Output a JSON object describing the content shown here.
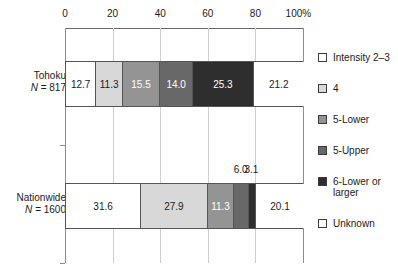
{
  "chart_data": {
    "type": "bar",
    "orientation": "horizontal",
    "stacked": true,
    "stacked_mode": "percent",
    "title": "",
    "subtitle": "",
    "xlabel": "",
    "ylabel": "",
    "xlim": [
      0,
      100
    ],
    "xticks": [
      0,
      20,
      40,
      60,
      80,
      100
    ],
    "xtick_labels": [
      "0",
      "20",
      "40",
      "60",
      "80",
      "100%"
    ],
    "grid": true,
    "grid_axis": "x",
    "legend_position": "right",
    "categories": [
      "Tohoku",
      "Nationwide"
    ],
    "category_labels": [
      {
        "name": "Tohoku",
        "n_text": "N = 817",
        "n_prefix": "N",
        "n_value": "= 817"
      },
      {
        "name": "Nationwide",
        "n_text": "N = 1600",
        "n_prefix": "N",
        "n_value": "= 1600"
      }
    ],
    "series": [
      {
        "name": "Intensity 2–3",
        "color": "#ffffff",
        "values": [
          12.7,
          31.6
        ]
      },
      {
        "name": "4",
        "color": "#d8d8d8",
        "values": [
          11.3,
          27.9
        ]
      },
      {
        "name": "5-Lower",
        "color": "#949494",
        "values": [
          15.5,
          11.3
        ]
      },
      {
        "name": "5-Upper",
        "color": "#686868",
        "values": [
          14.0,
          6.0
        ]
      },
      {
        "name": "6-Lower or\nlarger",
        "color": "#2e2e2e",
        "values": [
          25.3,
          3.1
        ]
      },
      {
        "name": "Unknown",
        "color": "#ffffff",
        "values": [
          21.2,
          20.1
        ]
      }
    ],
    "bars": [
      {
        "category": "Tohoku",
        "segments": [
          {
            "series": "Intensity 2–3",
            "value": 12.7,
            "label": "12.7",
            "color": "#ffffff",
            "label_color": "dark",
            "label_placement": "inside"
          },
          {
            "series": "4",
            "value": 11.3,
            "label": "11.3",
            "color": "#d8d8d8",
            "label_color": "dark",
            "label_placement": "inside"
          },
          {
            "series": "5-Lower",
            "value": 15.5,
            "label": "15.5",
            "color": "#949494",
            "label_color": "light",
            "label_placement": "inside"
          },
          {
            "series": "5-Upper",
            "value": 14.0,
            "label": "14.0",
            "color": "#686868",
            "label_color": "light",
            "label_placement": "inside"
          },
          {
            "series": "6-Lower or larger",
            "value": 25.3,
            "label": "25.3",
            "color": "#2e2e2e",
            "label_color": "light",
            "label_placement": "inside"
          },
          {
            "series": "Unknown",
            "value": 21.2,
            "label": "21.2",
            "color": "#ffffff",
            "label_color": "dark",
            "label_placement": "inside"
          }
        ]
      },
      {
        "category": "Nationwide",
        "segments": [
          {
            "series": "Intensity 2–3",
            "value": 31.6,
            "label": "31.6",
            "color": "#ffffff",
            "label_color": "dark",
            "label_placement": "inside"
          },
          {
            "series": "4",
            "value": 27.9,
            "label": "27.9",
            "color": "#d8d8d8",
            "label_color": "dark",
            "label_placement": "inside"
          },
          {
            "series": "5-Lower",
            "value": 11.3,
            "label": "11.3",
            "color": "#949494",
            "label_color": "light",
            "label_placement": "inside"
          },
          {
            "series": "5-Upper",
            "value": 6.0,
            "label": "6.0",
            "color": "#686868",
            "label_color": "dark",
            "label_placement": "above"
          },
          {
            "series": "6-Lower or larger",
            "value": 3.1,
            "label": "3.1",
            "color": "#2e2e2e",
            "label_color": "dark",
            "label_placement": "above"
          },
          {
            "series": "Unknown",
            "value": 20.1,
            "label": "20.1",
            "color": "#ffffff",
            "label_color": "dark",
            "label_placement": "inside"
          }
        ]
      }
    ],
    "annotations": [
      {
        "text": "6.0",
        "x_percent": 76.8,
        "note": "callout for 5-Upper segment of Nationwide bar"
      },
      {
        "text": "3.1",
        "x_percent": 81.5,
        "note": "callout for 6-Lower or larger segment of Nationwide bar"
      }
    ]
  },
  "axis": {
    "ticks": [
      {
        "label": "0",
        "value": 0
      },
      {
        "label": "20",
        "value": 20
      },
      {
        "label": "40",
        "value": 40
      },
      {
        "label": "60",
        "value": 60
      },
      {
        "label": "80",
        "value": 80
      },
      {
        "label": "100%",
        "value": 100
      }
    ]
  },
  "legend": {
    "items": [
      {
        "label": "Intensity 2–3",
        "color": "#ffffff"
      },
      {
        "label": "4",
        "color": "#d8d8d8"
      },
      {
        "label": "5-Lower",
        "color": "#949494"
      },
      {
        "label": "5-Upper",
        "color": "#686868"
      },
      {
        "label": "6-Lower or\nlarger",
        "color": "#2e2e2e"
      },
      {
        "label": "Unknown",
        "color": "#ffffff"
      }
    ]
  },
  "colors": {
    "intensity_2_3": "#ffffff",
    "four": "#d8d8d8",
    "five_lower": "#949494",
    "five_upper": "#686868",
    "six_lower_or_larger": "#2e2e2e",
    "unknown": "#ffffff",
    "bar_outline": "#555555",
    "axis": "#6a6a6a",
    "gridline": "#cfcfcf",
    "text": "#1a1a1a",
    "background": "#ffffff"
  }
}
